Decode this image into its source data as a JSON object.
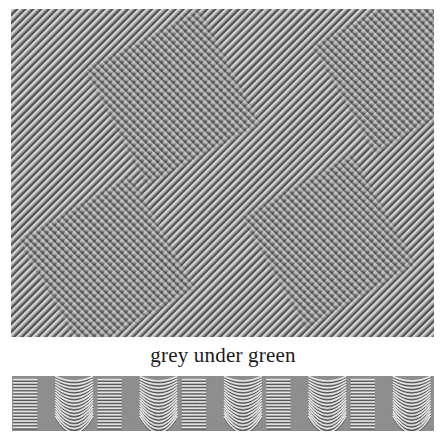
{
  "figure": {
    "caption": "grey under green",
    "background_color": "#ffffff",
    "text_color": "#1a1a1a"
  },
  "top_panel": {
    "name": "diagonal-stripe-texture-with-plaid-patches",
    "x": 11,
    "y": 9,
    "width": 423,
    "height": 328,
    "base_color": "#8a8a8a",
    "stripe_light": "#d8d8d8",
    "stripe_dark": "#4a4a4a",
    "stripe_angle_deg": -45,
    "stripe_period_px": 5.6,
    "patch_overlay_color": "#6f6f6f",
    "patches": [
      {
        "label": "patch-top-left",
        "cx": 162,
        "cy": 88,
        "size": 128,
        "rotation_deg": -28
      },
      {
        "label": "patch-top-right",
        "cx": 386,
        "cy": 60,
        "size": 122,
        "rotation_deg": -30
      },
      {
        "label": "patch-bottom-left",
        "cx": 96,
        "cy": 255,
        "size": 128,
        "rotation_deg": -30
      },
      {
        "label": "patch-bottom-right",
        "cx": 318,
        "cy": 232,
        "size": 126,
        "rotation_deg": -30
      }
    ]
  },
  "bottom_panel": {
    "name": "alternating-straight-and-curved-line-strip",
    "x": 12,
    "y": 376,
    "width": 422,
    "height": 55,
    "base_color": "#8b8b8b",
    "line_light": "#e8e8e8",
    "line_dark": "#3c3c3c",
    "cell_count": 10,
    "cell_width_px": 42.2,
    "line_count_per_cell": 16,
    "cell_types": [
      "straight",
      "curved",
      "straight",
      "curved",
      "straight",
      "curved",
      "straight",
      "curved",
      "straight",
      "curved"
    ]
  }
}
